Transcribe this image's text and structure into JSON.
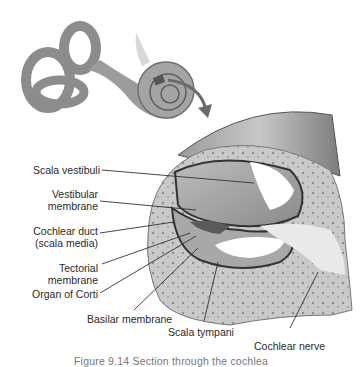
{
  "figure": {
    "caption": "Figure 9.14 Section through the cochlea",
    "labels": {
      "scala_vestibuli": "Scala vestibuli",
      "vestibular_membrane_1": "Vestibular",
      "vestibular_membrane_2": "membrane",
      "cochlear_duct_1": "Cochlear duct",
      "cochlear_duct_2": "(scala media)",
      "tectorial_membrane_1": "Tectorial",
      "tectorial_membrane_2": "membrane",
      "organ_of_corti": "Organ of Corti",
      "basilar_membrane": "Basilar membrane",
      "scala_tympani": "Scala tympani",
      "cochlear_nerve": "Cochlear nerve"
    }
  }
}
